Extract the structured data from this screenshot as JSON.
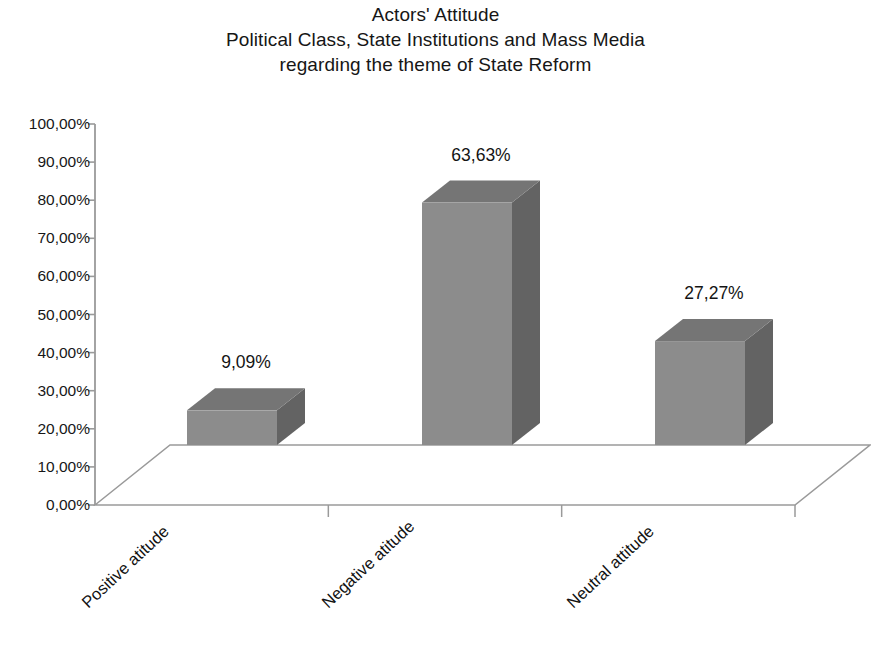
{
  "title": {
    "line1": "Actors' Attitude",
    "line2": "Political Class, State Institutions and Mass Media",
    "line3": "regarding the theme of State Reform"
  },
  "chart_data": {
    "type": "bar",
    "title": "Actors' Attitude Political Class, State Institutions and Mass Media regarding the theme of State Reform",
    "subtitle": "",
    "xlabel": "",
    "ylabel": "",
    "categories": [
      "Positive atitude",
      "Negative atitude",
      "Neutral attitude"
    ],
    "values": [
      9.09,
      63.63,
      27.27
    ],
    "value_labels": [
      "9,09%",
      "63,63%",
      "27,27%"
    ],
    "ylim": [
      0,
      100
    ],
    "ytick_values": [
      0,
      10,
      20,
      30,
      40,
      50,
      60,
      70,
      80,
      90,
      100
    ],
    "ytick_labels": [
      "0,00%",
      "10,00%",
      "20,00%",
      "30,00%",
      "40,00%",
      "50,00%",
      "60,00%",
      "70,00%",
      "80,00%",
      "90,00%",
      "100,00%"
    ],
    "grid": false,
    "legend": false,
    "legend_position": "none",
    "style": "3d-column",
    "series": [
      {
        "name": "Attitude share",
        "values": [
          9.09,
          63.63,
          27.27
        ]
      }
    ],
    "colors": {
      "bar_front": "#8c8c8c",
      "bar_top": "#757575",
      "bar_side": "#636363",
      "axis": "#9a9a9a",
      "text": "#141414",
      "background": "#ffffff"
    }
  }
}
